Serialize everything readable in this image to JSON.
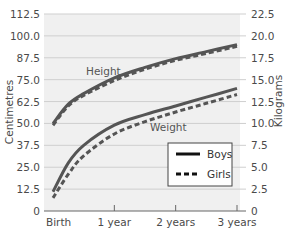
{
  "chart_data": {
    "type": "line",
    "title": "",
    "xlabel": "",
    "ylabel_left": "Centimetres",
    "ylabel_right": "Kilograms",
    "x_ticks": [
      "Birth",
      "1 year",
      "2 years",
      "3 years"
    ],
    "x": [
      0,
      0.25,
      0.5,
      1,
      1.5,
      2,
      2.5,
      3
    ],
    "y_left_ticks": [
      "0",
      "12.5",
      "25.0",
      "37.5",
      "50.0",
      "62.5",
      "75.0",
      "87.5",
      "100.0",
      "112.5"
    ],
    "y_right_ticks": [
      "0",
      "2.5",
      "5.0",
      "7.5",
      "10.0",
      "12.5",
      "15.0",
      "17.5",
      "20.0",
      "22.5"
    ],
    "ylim_left": [
      0,
      112.5
    ],
    "ylim_right": [
      0,
      22.5
    ],
    "grid": true,
    "legend_position": "lower right",
    "annotations": [
      "Height",
      "Weight"
    ],
    "series": [
      {
        "name": "Boys height (cm)",
        "group": "Height",
        "sex": "Boys",
        "axis": "left",
        "style": "solid",
        "values": [
          50,
          61,
          67,
          76,
          82,
          87,
          91,
          95
        ]
      },
      {
        "name": "Girls height (cm)",
        "group": "Height",
        "sex": "Girls",
        "axis": "left",
        "style": "dashed",
        "values": [
          49,
          60,
          66,
          74.5,
          81,
          86,
          90,
          94
        ]
      },
      {
        "name": "Boys weight (kg)",
        "group": "Weight",
        "sex": "Boys",
        "axis": "right",
        "style": "solid",
        "values": [
          2.2,
          5.5,
          7.5,
          9.8,
          11,
          12,
          13,
          14
        ]
      },
      {
        "name": "Girls weight (kg)",
        "group": "Weight",
        "sex": "Girls",
        "axis": "right",
        "style": "dashed",
        "values": [
          1.5,
          4.2,
          6.3,
          8.8,
          10.2,
          11.3,
          12.3,
          13.3
        ]
      }
    ],
    "legend": [
      {
        "label": "Boys",
        "style": "solid"
      },
      {
        "label": "Girls",
        "style": "dashed"
      }
    ]
  },
  "colors": {
    "plot_bg": "#f0f0f0",
    "grid": "#cfcfcf",
    "line": "#555555",
    "axis": "#666666"
  }
}
